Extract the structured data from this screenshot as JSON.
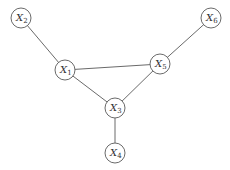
{
  "diagram": {
    "type": "undirected-graph",
    "nodes": [
      {
        "id": "X1",
        "label": "X",
        "sub": "1",
        "x": 65,
        "y": 70
      },
      {
        "id": "X2",
        "label": "X",
        "sub": "2",
        "x": 21,
        "y": 18
      },
      {
        "id": "X3",
        "label": "X",
        "sub": "3",
        "x": 115,
        "y": 108
      },
      {
        "id": "X4",
        "label": "X",
        "sub": "4",
        "x": 115,
        "y": 153
      },
      {
        "id": "X5",
        "label": "X",
        "sub": "5",
        "x": 160,
        "y": 64
      },
      {
        "id": "X6",
        "label": "X",
        "sub": "6",
        "x": 211,
        "y": 18
      }
    ],
    "edges": [
      [
        "X2",
        "X1"
      ],
      [
        "X1",
        "X5"
      ],
      [
        "X1",
        "X3"
      ],
      [
        "X5",
        "X3"
      ],
      [
        "X5",
        "X6"
      ],
      [
        "X3",
        "X4"
      ]
    ],
    "colors": {
      "stroke": "#6a6a6a",
      "text": "#333333",
      "background": "#ffffff"
    }
  }
}
